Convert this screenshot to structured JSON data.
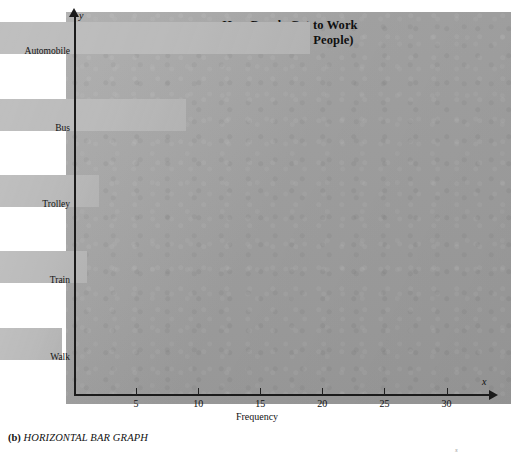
{
  "figure": {
    "caption_label": "(b)",
    "caption_text": "HORIZONTAL BAR GRAPH",
    "stray_mark": "s"
  },
  "axes": {
    "y_axis_symbol": "y",
    "x_axis_symbol": "x",
    "x_title": "Frequency"
  },
  "chart_data": {
    "type": "bar",
    "orientation": "horizontal",
    "title": "How People Get to Work\n(A Survey of 60 People)",
    "title_line1": "How People Get to Work",
    "title_line2": "(A Survey of 60 People)",
    "categories": [
      "Automobile",
      "Bus",
      "Trolley",
      "Train",
      "Walk"
    ],
    "values": [
      25,
      15,
      8,
      7,
      5
    ],
    "xlabel": "Frequency",
    "ylabel": "",
    "xlim": [
      0,
      33.5
    ],
    "xticks": [
      5,
      10,
      15,
      20,
      25,
      30
    ],
    "xticklabels": [
      "5",
      "10",
      "15",
      "20",
      "25",
      "30"
    ],
    "grid": false,
    "legend": false,
    "total": 60,
    "bar_color": "#b6b6b6",
    "background_color": "#a6a6a6",
    "axis_color": "#1b1b1b"
  }
}
